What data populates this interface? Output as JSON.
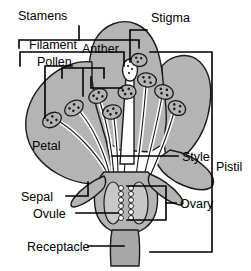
{
  "diagram": {
    "type": "botanical-diagram",
    "colors": {
      "tissue_gray": "#b4b4b4",
      "tissue_gray_dark": "#9a9a9a",
      "white": "#ffffff",
      "outline": "#1a1a1a",
      "background": "#ffffff"
    },
    "labels": {
      "stamens": "Stamens",
      "filament": "Filament",
      "pollen": "Pollen",
      "anther": "Anther",
      "stigma": "Stigma",
      "petal": "Petal",
      "style": "Style",
      "pistil": "Pistil",
      "sepal": "Sepal",
      "ovule": "Ovule",
      "ovary": "Ovary",
      "receptacle": "Receptacle"
    },
    "parts": [
      {
        "name": "stamens",
        "label": "Stamens",
        "annotation": "bracket",
        "group": "male"
      },
      {
        "name": "filament",
        "label": "Filament",
        "annotation": "bracket",
        "group": "male"
      },
      {
        "name": "pollen",
        "label": "Pollen",
        "annotation": "bracket",
        "group": "male"
      },
      {
        "name": "anther",
        "label": "Anther",
        "annotation": "bracket",
        "group": "male"
      },
      {
        "name": "stigma",
        "label": "Stigma",
        "annotation": "leader",
        "group": "female"
      },
      {
        "name": "style",
        "label": "Style",
        "annotation": "leader",
        "group": "female"
      },
      {
        "name": "ovary",
        "label": "Ovary",
        "annotation": "bracket",
        "group": "female"
      },
      {
        "name": "ovule",
        "label": "Ovule",
        "annotation": "leader",
        "group": "female"
      },
      {
        "name": "pistil",
        "label": "Pistil",
        "annotation": "bracket",
        "group": "female"
      },
      {
        "name": "petal",
        "label": "Petal",
        "annotation": "direct",
        "group": "accessory"
      },
      {
        "name": "sepal",
        "label": "Sepal",
        "annotation": "bracket",
        "group": "accessory"
      },
      {
        "name": "receptacle",
        "label": "Receptacle",
        "annotation": "leader",
        "group": "accessory"
      }
    ],
    "counts": {
      "anthers": 9,
      "ovule_chambers": 2
    }
  }
}
